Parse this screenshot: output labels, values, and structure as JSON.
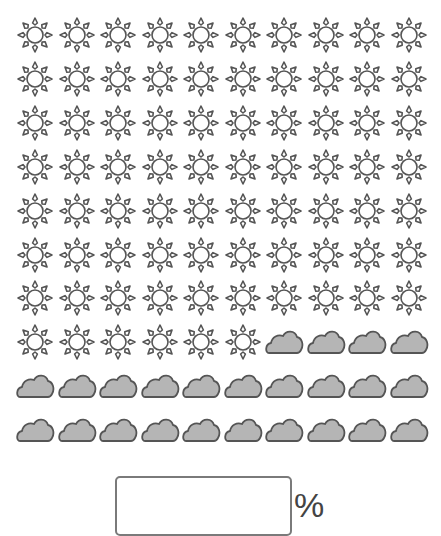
{
  "figure": {
    "grid_rows": 10,
    "grid_cols": 10,
    "total_icons": 100,
    "sun_count": 76,
    "cloud_count": 24,
    "icons": {
      "sun": {
        "name": "sun-icon",
        "stroke": "#555555",
        "fill": "#ffffff"
      },
      "cloud": {
        "name": "cloud-icon",
        "stroke": "#555555",
        "fill": "#b5b5b5"
      }
    },
    "layout": {
      "first_x": 15,
      "first_y": 15,
      "col_step": 41.5,
      "row_step": 43.9
    }
  },
  "answer": {
    "value": "",
    "unit_label": "%"
  }
}
